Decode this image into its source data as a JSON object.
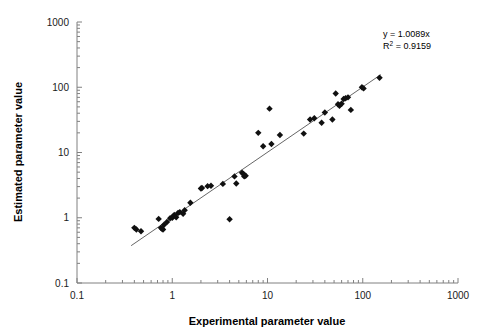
{
  "chart_data": {
    "type": "scatter",
    "title": "",
    "xlabel": "Experimental parameter value",
    "ylabel": "Estimated parameter value",
    "xscale": "log",
    "yscale": "log",
    "xlim": [
      0.1,
      1000
    ],
    "ylim": [
      0.1,
      1000
    ],
    "xticks": [
      0.1,
      1,
      10,
      100,
      1000
    ],
    "xticklabels": [
      "0.1",
      "1",
      "10",
      "100",
      "1000"
    ],
    "yticks": [
      0.1,
      1,
      10,
      100,
      1000
    ],
    "yticklabels": [
      "0.1",
      "1",
      "10",
      "100",
      "1000"
    ],
    "minor_ticks": true,
    "grid": false,
    "legend": null,
    "marker": "diamond",
    "marker_color": "#101010",
    "line_color": "#555555",
    "annotations": {
      "equation": "y = 1.0089x",
      "r_squared_prefix": "R",
      "r_squared_sup": "2",
      "r_squared_value": " = 0.9159",
      "position": "top-right"
    },
    "fit": {
      "slope": 1.0089,
      "intercept": 0,
      "r_squared": 0.9159,
      "x_start": 0.37,
      "x_end": 155
    },
    "points": [
      [
        0.4,
        0.7
      ],
      [
        0.42,
        0.66
      ],
      [
        0.47,
        0.62
      ],
      [
        0.72,
        0.96
      ],
      [
        0.76,
        0.7
      ],
      [
        0.78,
        0.68
      ],
      [
        0.8,
        0.66
      ],
      [
        0.82,
        0.78
      ],
      [
        0.88,
        0.86
      ],
      [
        0.95,
        0.98
      ],
      [
        1.0,
        1.0
      ],
      [
        1.02,
        1.05
      ],
      [
        1.05,
        1.1
      ],
      [
        1.1,
        1.02
      ],
      [
        1.15,
        1.18
      ],
      [
        1.2,
        1.22
      ],
      [
        1.3,
        1.15
      ],
      [
        1.35,
        1.3
      ],
      [
        1.55,
        1.7
      ],
      [
        2.0,
        2.8
      ],
      [
        2.05,
        2.85
      ],
      [
        2.35,
        3.05
      ],
      [
        2.55,
        3.1
      ],
      [
        3.4,
        3.3
      ],
      [
        4.0,
        0.95
      ],
      [
        4.5,
        4.3
      ],
      [
        4.7,
        3.35
      ],
      [
        5.4,
        4.9
      ],
      [
        5.6,
        4.7
      ],
      [
        5.7,
        4.3
      ],
      [
        5.9,
        4.4
      ],
      [
        8.0,
        20.0
      ],
      [
        9.0,
        12.5
      ],
      [
        10.5,
        47.0
      ],
      [
        11.0,
        13.5
      ],
      [
        13.5,
        18.5
      ],
      [
        24.0,
        19.5
      ],
      [
        28.0,
        32.0
      ],
      [
        31.0,
        33.5
      ],
      [
        37.0,
        28.5
      ],
      [
        40.0,
        41.0
      ],
      [
        48.0,
        32.0
      ],
      [
        52.0,
        80.0
      ],
      [
        55.0,
        55.0
      ],
      [
        57.0,
        52.0
      ],
      [
        60.0,
        56.0
      ],
      [
        63.0,
        66.0
      ],
      [
        66.0,
        68.0
      ],
      [
        70.0,
        70.0
      ],
      [
        75.0,
        45.0
      ],
      [
        98.0,
        100.0
      ],
      [
        102.0,
        96.0
      ],
      [
        150.0,
        140.0
      ]
    ]
  }
}
